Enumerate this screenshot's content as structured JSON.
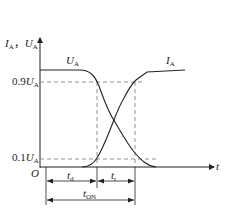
{
  "diagram": {
    "type": "switching-waveform",
    "y_axis": {
      "label_i": "I",
      "label_i_sub": "A",
      "sep": "，",
      "label_u": "U",
      "label_u_sub": "A"
    },
    "x_axis": {
      "label": "t",
      "origin": "O"
    },
    "curves": [
      {
        "name": "U_A",
        "label": "U",
        "sub": "A",
        "behavior": "falling"
      },
      {
        "name": "I_A",
        "label": "I",
        "sub": "A",
        "behavior": "rising"
      }
    ],
    "levels": [
      {
        "coef": "0.9",
        "var": "U",
        "sub": "A"
      },
      {
        "coef": "0.1",
        "var": "U",
        "sub": "A"
      }
    ],
    "intervals": [
      {
        "label": "t",
        "sub": "d"
      },
      {
        "label": "t",
        "sub": "r"
      },
      {
        "label": "t",
        "sub": "ON"
      }
    ],
    "colors": {
      "line": "#222222",
      "dash": "#777777"
    }
  }
}
